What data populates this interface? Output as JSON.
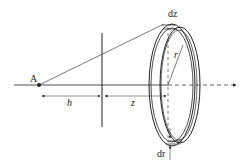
{
  "diagram": {
    "type": "geometry-figure",
    "labels": {
      "point": "A",
      "h": "h",
      "z": "z",
      "r": "r",
      "dz": "dz",
      "dr": "dr"
    },
    "colors": {
      "line": "#222222",
      "background": "#ffffff"
    }
  }
}
